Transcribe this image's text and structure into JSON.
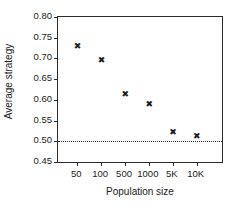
{
  "chart_data": {
    "type": "scatter",
    "title": "",
    "xlabel": "Population size",
    "ylabel": "Average strategy",
    "categories": [
      "50",
      "100",
      "500",
      "1000",
      "5K",
      "10K"
    ],
    "values": [
      0.729,
      0.695,
      0.612,
      0.588,
      0.522,
      0.512
    ],
    "series": [
      {
        "name": "Average strategy",
        "values": [
          0.729,
          0.695,
          0.612,
          0.588,
          0.522,
          0.512
        ]
      }
    ],
    "ylim": [
      0.45,
      0.8
    ],
    "yticks": [
      0.45,
      0.5,
      0.55,
      0.6,
      0.65,
      0.7,
      0.75,
      0.8
    ],
    "yticklabels": [
      "0.45",
      "0.50",
      "0.55",
      "0.60",
      "0.65",
      "0.70",
      "0.75",
      "0.80"
    ],
    "xticklabels": [
      "50",
      "100",
      "500",
      "1000",
      "5K",
      "10K"
    ],
    "grid": false,
    "legend": "none",
    "annotations": [
      {
        "name": "reference-line",
        "type": "hline",
        "value": 0.5,
        "style": "dotted"
      }
    ],
    "marker": "x",
    "marker_color": "#1a1a1a",
    "axis_color": "#2b2b2b",
    "background": "#ffffff"
  }
}
